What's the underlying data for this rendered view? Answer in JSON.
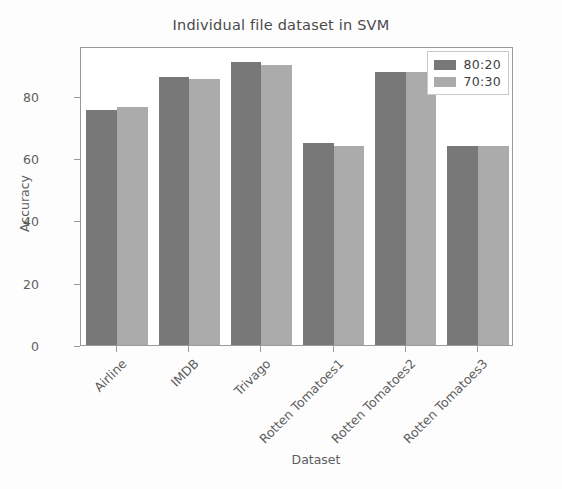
{
  "chart_data": {
    "type": "bar",
    "title": "Individual file dataset in SVM",
    "xlabel": "Dataset",
    "ylabel": "Accuracy",
    "categories": [
      "Airline",
      "IMDB",
      "Trivago",
      "Rotten Tomatoes1",
      "Rotten Tomatoes2",
      "Rotten Tomatoes3"
    ],
    "series": [
      {
        "name": "80:20",
        "color": "#787878",
        "values": [
          75.5,
          86,
          91,
          64.8,
          87.5,
          64
        ]
      },
      {
        "name": "70:30",
        "color": "#ababab",
        "values": [
          76.5,
          85.5,
          90,
          64,
          87.5,
          64
        ]
      }
    ],
    "ylim": [
      0,
      96
    ],
    "yticks": [
      0,
      20,
      40,
      60,
      80
    ],
    "ytick_labels": [
      "0",
      "20",
      "40",
      "60",
      "80"
    ],
    "grid": false,
    "legend_position": "upper right"
  }
}
